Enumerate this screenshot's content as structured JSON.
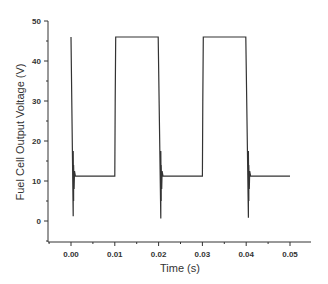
{
  "chart_data": {
    "type": "line",
    "title": "",
    "xlabel": "Time (s)",
    "ylabel": "Fuel Cell Output Voltage (V)",
    "xlim": [
      -0.0045,
      0.0548
    ],
    "ylim": [
      -5,
      50
    ],
    "x_ticks": [
      "0.00",
      "0.01",
      "0.02",
      "0.03",
      "0.04",
      "0.05"
    ],
    "y_ticks": [
      "0",
      "10",
      "20",
      "30",
      "40",
      "50"
    ],
    "grid": false,
    "legend": null,
    "series": [
      {
        "name": "Fuel Cell Output Voltage",
        "color": "#333333",
        "x": [
          0.0,
          0.0005,
          0.0005,
          0.0006,
          0.0006,
          0.0007,
          0.0008,
          0.001,
          0.01,
          0.0101,
          0.0102,
          0.0199,
          0.0205,
          0.0205,
          0.0206,
          0.0206,
          0.0207,
          0.0208,
          0.021,
          0.03,
          0.0301,
          0.0302,
          0.0399,
          0.0405,
          0.0405,
          0.0406,
          0.0406,
          0.0407,
          0.0408,
          0.041,
          0.05
        ],
        "y": [
          46,
          1.2,
          17.5,
          5,
          14,
          8,
          12.5,
          11.2,
          11.2,
          30,
          46,
          46,
          0.6,
          17.5,
          5,
          14,
          8,
          12.5,
          11.2,
          11.2,
          30,
          46,
          46,
          0.8,
          17.5,
          5,
          14,
          8,
          12.5,
          11.2,
          11.2
        ]
      }
    ],
    "annotations": []
  }
}
